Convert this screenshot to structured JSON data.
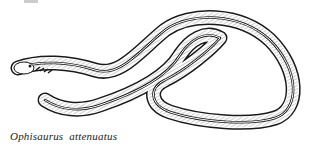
{
  "figure": {
    "caption": "Ophisaurus attenuatus",
    "colors": {
      "ink": "#1a1a1a",
      "background": "#ffffff"
    }
  }
}
